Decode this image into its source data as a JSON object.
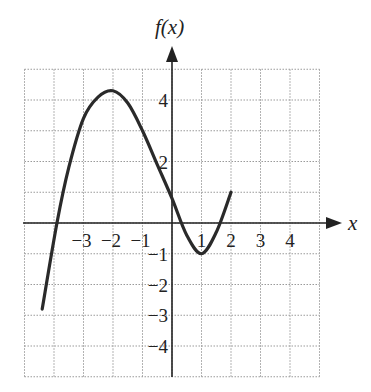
{
  "chart_data": {
    "type": "line",
    "title": "",
    "xlabel": "x",
    "ylabel": "f(x)",
    "xlim": [
      -5,
      5
    ],
    "ylim": [
      -5,
      5
    ],
    "grid": true,
    "x_ticks": [
      "-3",
      "-2",
      "-1",
      "1",
      "2",
      "3",
      "4"
    ],
    "y_ticks": [
      "4",
      "2",
      "-1",
      "-2",
      "-3",
      "-4"
    ],
    "series": [
      {
        "name": "f(x)",
        "x": [
          -4.4,
          -3.9,
          -3.5,
          -3,
          -2.5,
          -2,
          -1.5,
          -1,
          -0.5,
          0,
          0.5,
          1,
          1.5,
          2
        ],
        "values": [
          -2.8,
          0,
          1.8,
          3.4,
          4.1,
          4.3,
          3.9,
          3.0,
          1.9,
          0.8,
          -0.4,
          -1.0,
          -0.3,
          1.0
        ]
      }
    ]
  }
}
